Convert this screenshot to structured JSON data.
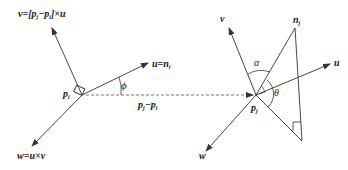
{
  "diagram": {
    "type": "vector-geometry",
    "left_frame": {
      "origin_label": "p",
      "origin_sub": "i",
      "v_label": "v=[p",
      "v_label_full": "v=[p_j−p_i]×u",
      "u_label_full": "u=n_i",
      "w_label_full": "w=u×v",
      "angle_label": "ϕ",
      "baseline_label_full": "p_j−p_i"
    },
    "right_frame": {
      "origin_label_full": "p_j",
      "v_label": "v",
      "u_label": "u",
      "w_label": "w",
      "normal_label_full": "n_j",
      "alpha_label": "α",
      "theta_label": "θ"
    },
    "colors": {
      "stroke": "#333333",
      "dashed": "#555555",
      "background": "#ffffff"
    }
  },
  "text": {
    "v": "v",
    "eq": "=",
    "lb": "[",
    "rb": "]",
    "p": "p",
    "minus": "−",
    "times": "×",
    "u": "u",
    "n": "n",
    "w": "w",
    "i": "i",
    "j": "j",
    "phi": "ϕ",
    "alpha": "α",
    "theta": "θ"
  }
}
